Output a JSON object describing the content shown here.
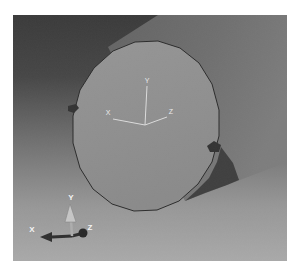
{
  "viewport": {
    "description": "3D CAE viewport showing a gray cylinder with highlighted circular end face",
    "face_csys": {
      "x_label": "X",
      "y_label": "Y",
      "z_label": "Z"
    },
    "view_triad": {
      "x_label": "X",
      "y_label": "Y",
      "z_label": "Z"
    },
    "colors": {
      "page_margin": "#ffffff",
      "background_top": "#3a3a3a",
      "background_bottom": "#a9a9a9",
      "cylinder_side": "#6d6d6d",
      "cylinder_shadow_wedge": "#3f3f3f",
      "face_fill": "#8f8f8f",
      "face_outline": "#2b2b2b",
      "csys_line": "#dcdcdc",
      "csys_label": "#ececec",
      "triad_dark_arrow": "#2e2e2e",
      "triad_light_arrow": "#c6c6c6",
      "triad_label": "#f5f5f5",
      "edge_marker": "#333333"
    }
  }
}
